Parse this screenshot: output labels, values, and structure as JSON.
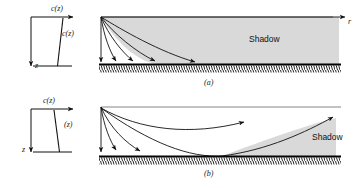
{
  "figure": {
    "type": "ray-diagram",
    "panels": [
      {
        "id": "a",
        "caption": "(a)",
        "profile": {
          "top_label": "c(z)",
          "curve_label": "c(z)",
          "depth_axis_label": "z",
          "gradient": "negative",
          "note": "sound speed decreases with depth; rays bend downward"
        },
        "field": {
          "range_axis_label": "r",
          "shadow_label": "Shadow",
          "ray_count": 5,
          "shadow_position": "upper-right"
        }
      },
      {
        "id": "b",
        "caption": "(b)",
        "profile": {
          "top_label": "c(z)",
          "curve_label": "(z)",
          "depth_axis_label": "z",
          "gradient": "positive",
          "note": "sound speed increases with depth; rays refract upward"
        },
        "field": {
          "range_axis_label": "",
          "shadow_label": "Shadow",
          "ray_count": 4,
          "shadow_position": "lower-right"
        }
      }
    ],
    "colors": {
      "ink": "#1a1a1a",
      "shadow_fill": "#d8d8d8",
      "ground": "#000000"
    }
  }
}
